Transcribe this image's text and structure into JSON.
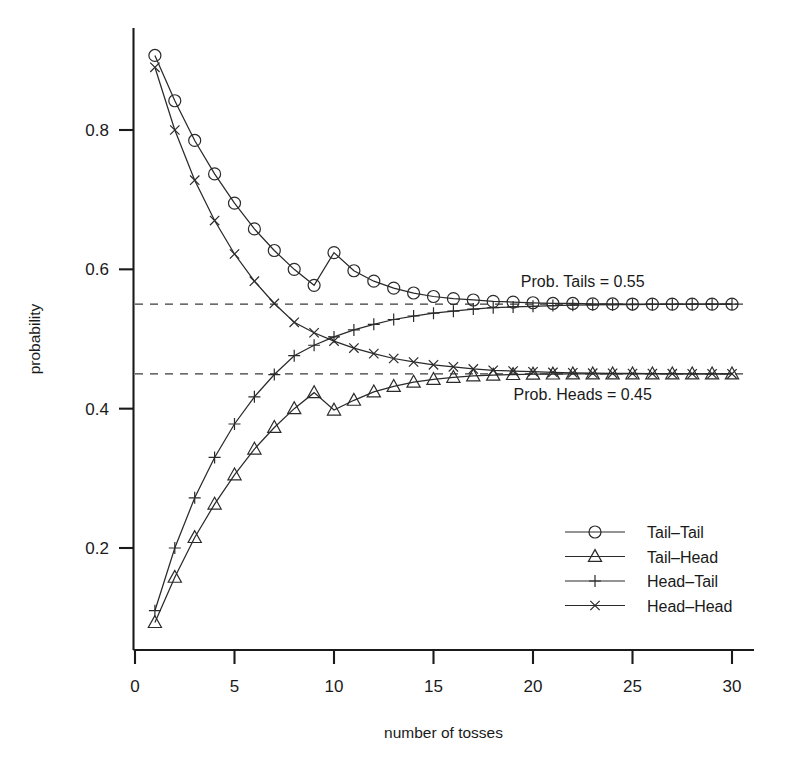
{
  "chart_data": {
    "type": "line",
    "title": "",
    "xlabel": "number of tosses",
    "ylabel": "probability",
    "xlim": [
      0,
      30.8
    ],
    "ylim": [
      0.06,
      0.95
    ],
    "grid": false,
    "legend_position": "bottom-right",
    "x_ticks": [
      "0",
      "5",
      "10",
      "15",
      "20",
      "25",
      "30"
    ],
    "x_tick_values": [
      0,
      5,
      10,
      15,
      20,
      25,
      30
    ],
    "y_ticks": [
      "0.2",
      "0.4",
      "0.6",
      "0.8"
    ],
    "y_tick_values": [
      0.2,
      0.4,
      0.6,
      0.8
    ],
    "x": [
      1,
      2,
      3,
      4,
      5,
      6,
      7,
      8,
      9,
      10,
      11,
      12,
      13,
      14,
      15,
      16,
      17,
      18,
      19,
      20,
      21,
      22,
      23,
      24,
      25,
      26,
      27,
      28,
      29,
      30
    ],
    "series": [
      {
        "name": "Tail-Tail",
        "marker": "circle",
        "values": [
          0.907,
          0.842,
          0.785,
          0.737,
          0.695,
          0.658,
          0.627,
          0.6,
          0.577,
          0.624,
          0.598,
          0.583,
          0.573,
          0.566,
          0.561,
          0.558,
          0.556,
          0.554,
          0.553,
          0.552,
          0.551,
          0.551,
          0.5505,
          0.5503,
          0.5502,
          0.5501,
          0.5501,
          0.55,
          0.55,
          0.55
        ]
      },
      {
        "name": "Tail-Head",
        "marker": "triangle",
        "values": [
          0.093,
          0.158,
          0.215,
          0.263,
          0.305,
          0.342,
          0.373,
          0.4,
          0.423,
          0.398,
          0.412,
          0.424,
          0.432,
          0.438,
          0.442,
          0.445,
          0.447,
          0.448,
          0.449,
          0.4495,
          0.4497,
          0.4498,
          0.4499,
          0.4499,
          0.45,
          0.45,
          0.45,
          0.45,
          0.45,
          0.45
        ]
      },
      {
        "name": "Head-Tail",
        "marker": "plus",
        "values": [
          0.11,
          0.2,
          0.272,
          0.33,
          0.378,
          0.417,
          0.449,
          0.476,
          0.491,
          0.503,
          0.513,
          0.521,
          0.528,
          0.533,
          0.537,
          0.54,
          0.543,
          0.545,
          0.546,
          0.547,
          0.548,
          0.5485,
          0.549,
          0.5493,
          0.5495,
          0.5497,
          0.5498,
          0.5499,
          0.5499,
          0.55
        ]
      },
      {
        "name": "Head-Head",
        "marker": "cross",
        "values": [
          0.89,
          0.8,
          0.728,
          0.67,
          0.622,
          0.583,
          0.551,
          0.524,
          0.509,
          0.497,
          0.487,
          0.479,
          0.472,
          0.467,
          0.463,
          0.46,
          0.457,
          0.455,
          0.454,
          0.453,
          0.452,
          0.4515,
          0.451,
          0.4507,
          0.4505,
          0.4503,
          0.4502,
          0.4501,
          0.4501,
          0.45
        ]
      }
    ],
    "reference_lines": [
      {
        "label": "Prob. Tails = 0.55",
        "value": 0.55,
        "style": "dashed"
      },
      {
        "label": "Prob. Heads = 0.45",
        "value": 0.45,
        "style": "dashed"
      }
    ],
    "annotations": [
      {
        "text": "Prob. Tails = 0.55",
        "x": 22.5,
        "y": 0.574
      },
      {
        "text": "Prob. Heads = 0.45",
        "x": 22.5,
        "y": 0.413
      }
    ],
    "legend": [
      {
        "label": "Tail–Tail",
        "marker": "circle"
      },
      {
        "label": "Tail–Head",
        "marker": "triangle"
      },
      {
        "label": "Head–Tail",
        "marker": "plus"
      },
      {
        "label": "Head–Head",
        "marker": "cross"
      }
    ],
    "colors": {
      "line": "#2a2a2a",
      "axis": "#1a1a1a",
      "reference": "#3a3a3a",
      "background": "#ffffff"
    }
  }
}
